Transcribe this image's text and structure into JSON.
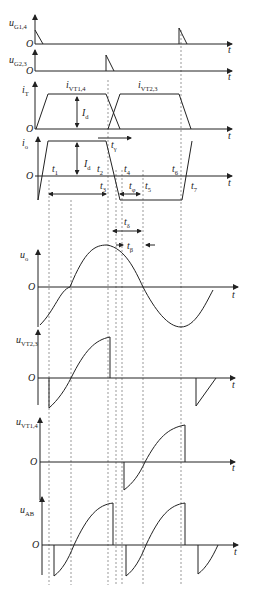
{
  "diagram": {
    "title": "",
    "type": "waveform-timing-diagram",
    "time_axis_label": "t",
    "origin_label": "O",
    "panels": [
      {
        "id": "uG14",
        "label": "u",
        "sub": "G1,4"
      },
      {
        "id": "uG23",
        "label": "u",
        "sub": "G2,3"
      },
      {
        "id": "iT",
        "label": "i",
        "sub": "T",
        "curves": [
          {
            "label": "i",
            "sub": "VT1,4"
          },
          {
            "label": "i",
            "sub": "VT2,3"
          }
        ],
        "amplitude": {
          "label": "I",
          "sub": "d"
        }
      },
      {
        "id": "io",
        "label": "i",
        "sub": "o",
        "amplitude": {
          "label": "I",
          "sub": "d"
        }
      },
      {
        "id": "uo",
        "label": "u",
        "sub": "o"
      },
      {
        "id": "uVT23",
        "label": "u",
        "sub": "VT2,3"
      },
      {
        "id": "uVT14",
        "label": "u",
        "sub": "VT1,4"
      },
      {
        "id": "uAB",
        "label": "u",
        "sub": "AB"
      }
    ],
    "time_marks": [
      "t1",
      "t2",
      "t3",
      "t4",
      "t5",
      "t6",
      "t7"
    ],
    "intervals": [
      {
        "label": "t",
        "sub": "γ"
      },
      {
        "label": "t",
        "sub": "φ"
      },
      {
        "label": "t",
        "sub": "δ"
      },
      {
        "label": "t",
        "sub": "β"
      }
    ]
  }
}
